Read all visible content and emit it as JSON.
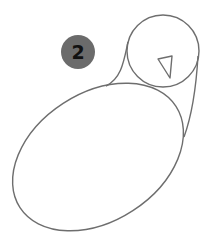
{
  "step": {
    "number": "2",
    "badge_color": "#6b6b6b",
    "text_color": "#111111"
  },
  "drawing": {
    "subject": "bird-outline",
    "stroke_color": "#6e6e6e",
    "fill_color": "#ffffff",
    "shapes": {
      "head": {
        "type": "circle",
        "cx": 163,
        "cy": 51,
        "r": 36
      },
      "beak": {
        "type": "triangle",
        "points": "158,59 172,56 170,78"
      },
      "body": {
        "type": "ellipse",
        "cx": 98,
        "cy": 157,
        "rx": 93,
        "ry": 64,
        "rotate": -33
      },
      "neck_left": {
        "type": "curve",
        "d": "M128,42 C124,60 122,78 106,86"
      },
      "neck_right": {
        "type": "curve",
        "d": "M198,56 C196,90 192,115 184,137"
      }
    }
  }
}
